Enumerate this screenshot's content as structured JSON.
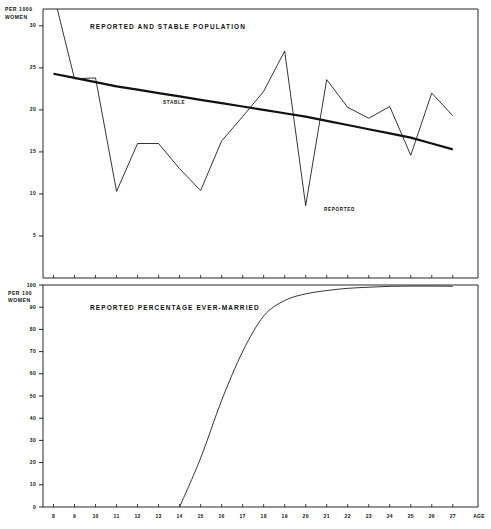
{
  "figure": {
    "background": "#ffffff",
    "ink": "#111111"
  },
  "chart_data": [
    {
      "type": "line",
      "title": "REPORTED AND STABLE  POPULATION",
      "panel": "top",
      "xlabel": "AGE",
      "ylabel": "PER 1000\nWOMEN",
      "ylabel_line1": "PER 1000",
      "ylabel_line2": "WOMEN",
      "xlim": [
        7.5,
        28.2
      ],
      "ylim": [
        0,
        32
      ],
      "yticks": [
        5,
        10,
        15,
        20,
        25,
        30
      ],
      "ytick_labels": [
        "5",
        "10",
        "15",
        "20",
        "25",
        "30"
      ],
      "xticks": [
        8,
        9,
        10,
        11,
        12,
        13,
        14,
        15,
        16,
        17,
        18,
        19,
        20,
        21,
        22,
        23,
        24,
        25,
        26,
        27
      ],
      "xtick_labels": [
        "8",
        "9",
        "10",
        "11",
        "12",
        "13",
        "14",
        "15",
        "16",
        "17",
        "18",
        "19",
        "20",
        "21",
        "22",
        "23",
        "24",
        "25",
        "26",
        "27"
      ],
      "grid": false,
      "legend_position": "inline-annotation",
      "x": [
        8,
        9,
        10,
        11,
        12,
        13,
        14,
        15,
        16,
        17,
        18,
        19,
        20,
        21,
        22,
        23,
        24,
        25,
        26,
        27
      ],
      "series": [
        {
          "name": "REPORTED",
          "label_text": "REPORTED",
          "style": "thin",
          "values": [
            33.8,
            23.7,
            23.8,
            10.3,
            16.0,
            16.0,
            13.0,
            10.4,
            16.3,
            19.2,
            22.2,
            27.0,
            8.6,
            23.6,
            20.3,
            19.0,
            20.4,
            14.6,
            22.0,
            19.3
          ]
        },
        {
          "name": "STABLE",
          "label_text": "STABLE",
          "style": "thick",
          "values": [
            24.3,
            23.8,
            23.3,
            22.8,
            22.4,
            22.0,
            21.6,
            21.2,
            20.8,
            20.4,
            20.0,
            19.6,
            19.2,
            18.7,
            18.2,
            17.7,
            17.2,
            16.7,
            16.0,
            15.3
          ]
        }
      ]
    },
    {
      "type": "line",
      "title": "REPORTED PERCENTAGE EVER-MARRIED",
      "panel": "bottom",
      "xlabel": "AGE",
      "ylabel": "PER 100\nWOMEN",
      "ylabel_line1": "PER 100",
      "ylabel_line2": "WOMEN",
      "xlim": [
        7.5,
        28.2
      ],
      "ylim": [
        0,
        100
      ],
      "yticks": [
        0,
        10,
        20,
        30,
        40,
        50,
        60,
        70,
        80,
        90,
        100
      ],
      "ytick_labels": [
        "0",
        "10",
        "20",
        "30",
        "40",
        "50",
        "60",
        "70",
        "80",
        "90",
        "100"
      ],
      "xticks": [
        8,
        9,
        10,
        11,
        12,
        13,
        14,
        15,
        16,
        17,
        18,
        19,
        20,
        21,
        22,
        23,
        24,
        25,
        26,
        27
      ],
      "xtick_labels": [
        "8",
        "9",
        "10",
        "11",
        "12",
        "13",
        "14",
        "15",
        "16",
        "17",
        "18",
        "19",
        "20",
        "21",
        "22",
        "23",
        "24",
        "25",
        "26",
        "27"
      ],
      "grid": false,
      "legend_position": "none",
      "x": [
        14,
        15,
        16,
        17,
        18,
        19,
        20,
        21,
        22,
        23,
        24,
        25,
        26,
        27
      ],
      "series": [
        {
          "name": "REPORTED PERCENTAGE EVER-MARRIED",
          "style": "thin",
          "values": [
            0,
            22,
            48,
            70,
            86,
            93,
            96,
            97.5,
            98.5,
            99,
            99.4,
            99.5,
            99.5,
            99.4
          ]
        }
      ]
    }
  ],
  "labels": {
    "top_y_axis_line1": "PER 1000",
    "top_y_axis_line2": "WOMEN",
    "bottom_y_axis_line1": "PER 100",
    "bottom_y_axis_line2": "WOMEN",
    "top_title": "REPORTED AND STABLE  POPULATION",
    "bottom_title": "REPORTED PERCENTAGE EVER-MARRIED",
    "stable_label": "STABLE",
    "reported_label": "REPORTED",
    "age_label": "AGE"
  }
}
